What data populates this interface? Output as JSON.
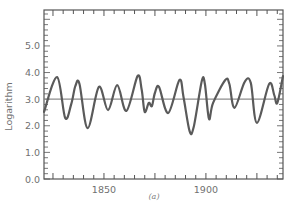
{
  "chart_data": {
    "type": "line",
    "title": "",
    "caption": "(a)",
    "xlabel": "",
    "ylabel": "Logarithm",
    "xlim": [
      1820.6,
      1937.8
    ],
    "ylim": [
      0.0,
      6.35
    ],
    "xticks_major": [
      1850,
      1900
    ],
    "xtick_labels": [
      "1850",
      "1900"
    ],
    "yticks_major": [
      0.0,
      1.0,
      2.0,
      3.0,
      4.0,
      5.0
    ],
    "ytick_labels": [
      "0.0",
      "1.0",
      "2.0",
      "3.0",
      "4.0",
      "5.0"
    ],
    "grid": false,
    "legend": null,
    "reference_line": {
      "orientation": "horizontal",
      "y": 3.0
    },
    "series": [
      {
        "name": "logarithm",
        "x": [
          1820.6,
          1827,
          1831,
          1834,
          1836,
          1838,
          1842,
          1847.5,
          1852,
          1856.5,
          1861,
          1866.5,
          1868.5,
          1870,
          1872,
          1873.5,
          1875,
          1877,
          1881.5,
          1887,
          1889,
          1892,
          1894,
          1898,
          1899.5,
          1901.5,
          1903.5,
          1909.5,
          1911.5,
          1914,
          1919,
          1922,
          1925,
          1931,
          1933.5,
          1935,
          1937.8
        ],
        "values": [
          2.52,
          3.83,
          2.29,
          2.82,
          3.5,
          3.57,
          1.91,
          3.46,
          2.59,
          3.53,
          2.56,
          3.87,
          3.35,
          2.52,
          2.86,
          2.74,
          3.23,
          3.46,
          2.48,
          3.72,
          3.08,
          1.8,
          1.95,
          3.68,
          3.57,
          2.26,
          2.86,
          3.72,
          3.57,
          2.67,
          3.65,
          3.61,
          2.11,
          3.57,
          3.16,
          2.86,
          3.87
        ]
      }
    ]
  },
  "colors": {
    "curve": "#5a5a5a",
    "reference_line": "#8c8c8c",
    "axis": "#555555",
    "labels": "#707070"
  }
}
